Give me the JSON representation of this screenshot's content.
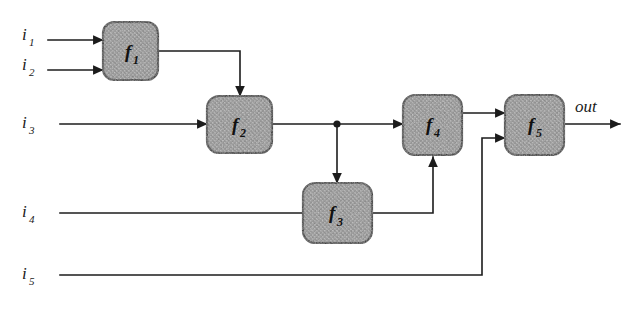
{
  "diagram": {
    "type": "block-diagram",
    "canvas": {
      "width": 638,
      "height": 309
    },
    "colors": {
      "wire": "#1c1c1c",
      "box_fill": "#9a9a9a",
      "box_stroke": "#262626",
      "text": "#1a1a1a",
      "background": "#ffffff"
    },
    "inputs": [
      {
        "id": "i1",
        "base": "i",
        "sub": "1",
        "label": "i1",
        "x": 22,
        "y": 40
      },
      {
        "id": "i2",
        "base": "i",
        "sub": "2",
        "label": "i2",
        "x": 22,
        "y": 70
      },
      {
        "id": "i3",
        "base": "i",
        "sub": "3",
        "label": "i3",
        "x": 22,
        "y": 124
      },
      {
        "id": "i4",
        "base": "i",
        "sub": "4",
        "label": "i4",
        "x": 22,
        "y": 213
      },
      {
        "id": "i5",
        "base": "i",
        "sub": "5",
        "label": "i5",
        "x": 22,
        "y": 275
      }
    ],
    "outputs": [
      {
        "id": "out",
        "label": "out",
        "x": 575,
        "y": 108
      }
    ],
    "nodes": [
      {
        "id": "f1",
        "base": "f",
        "sub": "1",
        "label": "f1",
        "x": 103,
        "y": 22,
        "w": 55,
        "h": 58
      },
      {
        "id": "f2",
        "base": "f",
        "sub": "2",
        "label": "f2",
        "x": 207,
        "y": 96,
        "w": 65,
        "h": 57
      },
      {
        "id": "f3",
        "base": "f",
        "sub": "3",
        "label": "f3",
        "x": 303,
        "y": 183,
        "w": 69,
        "h": 60
      },
      {
        "id": "f4",
        "base": "f",
        "sub": "4",
        "label": "f4",
        "x": 403,
        "y": 95,
        "w": 59,
        "h": 60
      },
      {
        "id": "f5",
        "base": "f",
        "sub": "5",
        "label": "f5",
        "x": 505,
        "y": 95,
        "w": 59,
        "h": 60
      }
    ],
    "edges": [
      {
        "id": "e-i1-f1",
        "from": "i1",
        "to": "f1",
        "path": "M 48 40 L 103 40",
        "arrow": true
      },
      {
        "id": "e-i2-f1",
        "from": "i2",
        "to": "f1",
        "path": "M 48 70 L 103 70",
        "arrow": true
      },
      {
        "id": "e-f1-f2",
        "from": "f1",
        "to": "f2",
        "path": "M 158 51 L 240 51 L 240 96",
        "arrow": true
      },
      {
        "id": "e-i3-f2",
        "from": "i3",
        "to": "f2",
        "path": "M 60 124 L 207 124",
        "arrow": true
      },
      {
        "id": "e-f2-f4",
        "from": "f2",
        "to": "f4",
        "path": "M 272 124 L 403 124",
        "arrow": true
      },
      {
        "id": "e-branch-f3",
        "from": "i3-junction",
        "to": "f3",
        "path": "M 337 124 L 337 183",
        "arrow": true
      },
      {
        "id": "e-i4-f3",
        "from": "i4",
        "to": "f3",
        "path": "M 60 213 L 303 213",
        "arrow": false
      },
      {
        "id": "e-f3-f4",
        "from": "f3",
        "to": "f4",
        "path": "M 372 213 L 433 213 L 433 155",
        "arrow": true
      },
      {
        "id": "e-f4-f5",
        "from": "f4",
        "to": "f5",
        "path": "M 462 113 L 505 113",
        "arrow": true
      },
      {
        "id": "e-i5-f5",
        "from": "i5",
        "to": "f5",
        "path": "M 60 275 L 482 275 L 482 138 L 505 138",
        "arrow": true
      },
      {
        "id": "e-f5-out",
        "from": "f5",
        "to": "out",
        "path": "M 564 124 L 620 124",
        "arrow": true
      }
    ],
    "junctions": [
      {
        "id": "j-i3",
        "on": "e-f2-f4",
        "x": 337,
        "y": 124,
        "r": 3.6
      }
    ]
  }
}
